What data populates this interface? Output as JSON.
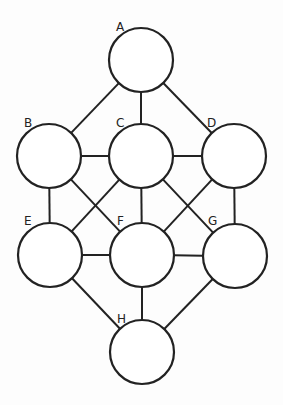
{
  "diagram": {
    "type": "graph",
    "nodes": [
      {
        "id": "A",
        "label": "A",
        "cx": 141,
        "cy": 60,
        "r": 32,
        "lx": 116,
        "ly": 31
      },
      {
        "id": "B",
        "label": "B",
        "cx": 49,
        "cy": 156,
        "r": 32,
        "lx": 24,
        "ly": 127
      },
      {
        "id": "C",
        "label": "C",
        "cx": 141,
        "cy": 156,
        "r": 32,
        "lx": 116,
        "ly": 127
      },
      {
        "id": "D",
        "label": "D",
        "cx": 234,
        "cy": 156,
        "r": 32,
        "lx": 207,
        "ly": 127
      },
      {
        "id": "E",
        "label": "E",
        "cx": 50,
        "cy": 255,
        "r": 32,
        "lx": 24,
        "ly": 225
      },
      {
        "id": "F",
        "label": "F",
        "cx": 142,
        "cy": 255,
        "r": 32,
        "lx": 117,
        "ly": 225
      },
      {
        "id": "G",
        "label": "G",
        "cx": 235,
        "cy": 256,
        "r": 32,
        "lx": 208,
        "ly": 225
      },
      {
        "id": "H",
        "label": "H",
        "cx": 142,
        "cy": 352,
        "r": 32,
        "lx": 117,
        "ly": 323
      }
    ],
    "edges": [
      [
        "A",
        "B"
      ],
      [
        "A",
        "C"
      ],
      [
        "A",
        "D"
      ],
      [
        "B",
        "C"
      ],
      [
        "C",
        "D"
      ],
      [
        "B",
        "E"
      ],
      [
        "B",
        "F"
      ],
      [
        "C",
        "E"
      ],
      [
        "C",
        "F"
      ],
      [
        "C",
        "G"
      ],
      [
        "D",
        "F"
      ],
      [
        "D",
        "G"
      ],
      [
        "E",
        "F"
      ],
      [
        "F",
        "G"
      ],
      [
        "E",
        "H"
      ],
      [
        "F",
        "H"
      ],
      [
        "G",
        "H"
      ]
    ]
  }
}
